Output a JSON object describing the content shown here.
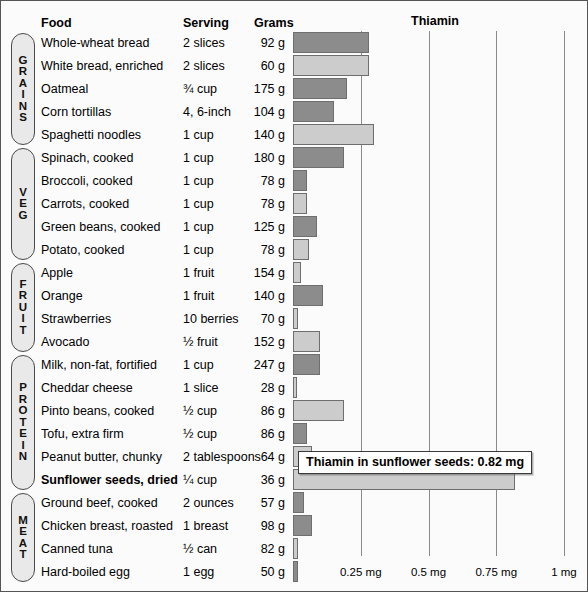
{
  "header": {
    "food": "Food",
    "serving": "Serving",
    "grams": "Grams",
    "thiamin": "Thiamin"
  },
  "groups": [
    {
      "name": "GRAINS",
      "letters": [
        "G",
        "R",
        "A",
        "I",
        "N",
        "S"
      ]
    },
    {
      "name": "VEG",
      "letters": [
        "V",
        "E",
        "G"
      ]
    },
    {
      "name": "FRUIT",
      "letters": [
        "F",
        "R",
        "U",
        "I",
        "T"
      ]
    },
    {
      "name": "PROTEIN",
      "letters": [
        "P",
        "R",
        "O",
        "T",
        "E",
        "I",
        "N"
      ]
    },
    {
      "name": "MEAT",
      "letters": [
        "M",
        "E",
        "A",
        "T"
      ]
    }
  ],
  "tooltip": {
    "text": "Thiamin in sunflower seeds: 0.82 mg"
  },
  "chart_data": {
    "type": "bar",
    "title": "Thiamin",
    "xlabel": "",
    "ylabel": "",
    "xlim": [
      0,
      1.05
    ],
    "grid": true,
    "orientation": "horizontal",
    "unit": "mg",
    "tick_labels": [
      "0.25 mg",
      "0.5 mg",
      "0.75 mg",
      "1 mg"
    ],
    "tick_values": [
      0.25,
      0.5,
      0.75,
      1
    ],
    "categories": [
      "Whole-wheat bread",
      "White bread, enriched",
      "Oatmeal",
      "Corn tortillas",
      "Spaghetti noodles",
      "Spinach, cooked",
      "Broccoli, cooked",
      "Carrots, cooked",
      "Green beans, cooked",
      "Potato, cooked",
      "Apple",
      "Orange",
      "Strawberries",
      "Avocado",
      "Milk, non-fat, fortified",
      "Cheddar cheese",
      "Pinto beans, cooked",
      "Tofu, extra firm",
      "Peanut butter, chunky",
      "Sunflower seeds, dried",
      "Ground beef, cooked",
      "Chicken breast, roasted",
      "Canned tuna",
      "Hard-boiled egg"
    ],
    "values": [
      0.28,
      0.28,
      0.2,
      0.15,
      0.3,
      0.19,
      0.05,
      0.05,
      0.09,
      0.06,
      0.03,
      0.11,
      0.02,
      0.1,
      0.1,
      0.01,
      0.19,
      0.05,
      0.07,
      0.82,
      0.04,
      0.07,
      0.02,
      0.02
    ],
    "rows": [
      {
        "group": "GRAINS",
        "food": "Whole-wheat bread",
        "serving": "2 slices",
        "grams": "92 g",
        "thiamin": 0.28,
        "shade": "dark"
      },
      {
        "group": "GRAINS",
        "food": "White bread, enriched",
        "serving": "2 slices",
        "grams": "60 g",
        "thiamin": 0.28,
        "shade": "light"
      },
      {
        "group": "GRAINS",
        "food": "Oatmeal",
        "serving": "¾ cup",
        "grams": "175 g",
        "thiamin": 0.2,
        "shade": "dark"
      },
      {
        "group": "GRAINS",
        "food": "Corn tortillas",
        "serving": "4, 6-inch",
        "grams": "104 g",
        "thiamin": 0.15,
        "shade": "dark"
      },
      {
        "group": "GRAINS",
        "food": "Spaghetti noodles",
        "serving": "1 cup",
        "grams": "140 g",
        "thiamin": 0.3,
        "shade": "light"
      },
      {
        "group": "VEG",
        "food": "Spinach, cooked",
        "serving": "1 cup",
        "grams": "180 g",
        "thiamin": 0.19,
        "shade": "dark"
      },
      {
        "group": "VEG",
        "food": "Broccoli, cooked",
        "serving": "1 cup",
        "grams": "78 g",
        "thiamin": 0.05,
        "shade": "dark"
      },
      {
        "group": "VEG",
        "food": "Carrots, cooked",
        "serving": "1 cup",
        "grams": "78 g",
        "thiamin": 0.05,
        "shade": "light"
      },
      {
        "group": "VEG",
        "food": "Green beans, cooked",
        "serving": "1 cup",
        "grams": "125 g",
        "thiamin": 0.09,
        "shade": "dark"
      },
      {
        "group": "VEG",
        "food": "Potato, cooked",
        "serving": "1 cup",
        "grams": "78 g",
        "thiamin": 0.06,
        "shade": "light"
      },
      {
        "group": "FRUIT",
        "food": "Apple",
        "serving": "1 fruit",
        "grams": "154 g",
        "thiamin": 0.03,
        "shade": "light"
      },
      {
        "group": "FRUIT",
        "food": "Orange",
        "serving": "1 fruit",
        "grams": "140 g",
        "thiamin": 0.11,
        "shade": "dark"
      },
      {
        "group": "FRUIT",
        "food": "Strawberries",
        "serving": "10 berries",
        "grams": "70 g",
        "thiamin": 0.02,
        "shade": "light"
      },
      {
        "group": "FRUIT",
        "food": "Avocado",
        "serving": "½ fruit",
        "grams": "152 g",
        "thiamin": 0.1,
        "shade": "light"
      },
      {
        "group": "PROTEIN",
        "food": "Milk, non-fat, fortified",
        "serving": "1 cup",
        "grams": "247 g",
        "thiamin": 0.1,
        "shade": "dark"
      },
      {
        "group": "PROTEIN",
        "food": "Cheddar cheese",
        "serving": "1 slice",
        "grams": "28 g",
        "thiamin": 0.01,
        "shade": "light"
      },
      {
        "group": "PROTEIN",
        "food": "Pinto beans, cooked",
        "serving": "½ cup",
        "grams": "86 g",
        "thiamin": 0.19,
        "shade": "light"
      },
      {
        "group": "PROTEIN",
        "food": "Tofu, extra firm",
        "serving": "½ cup",
        "grams": "86 g",
        "thiamin": 0.05,
        "shade": "dark"
      },
      {
        "group": "PROTEIN",
        "food": "Peanut butter, chunky",
        "serving": "2 tablespoons",
        "grams": "64 g",
        "thiamin": 0.07,
        "shade": "light"
      },
      {
        "group": "PROTEIN",
        "food": "Sunflower seeds, dried",
        "serving": "¼ cup",
        "grams": "36 g",
        "thiamin": 0.82,
        "shade": "light",
        "bold": true
      },
      {
        "group": "MEAT",
        "food": "Ground beef, cooked",
        "serving": "2 ounces",
        "grams": "57 g",
        "thiamin": 0.04,
        "shade": "dark"
      },
      {
        "group": "MEAT",
        "food": "Chicken breast, roasted",
        "serving": "1 breast",
        "grams": "98 g",
        "thiamin": 0.07,
        "shade": "dark"
      },
      {
        "group": "MEAT",
        "food": "Canned tuna",
        "serving": "½ can",
        "grams": "82 g",
        "thiamin": 0.02,
        "shade": "light"
      },
      {
        "group": "MEAT",
        "food": "Hard-boiled egg",
        "serving": "1 egg",
        "grams": "50 g",
        "thiamin": 0.02,
        "shade": "dark"
      }
    ]
  }
}
